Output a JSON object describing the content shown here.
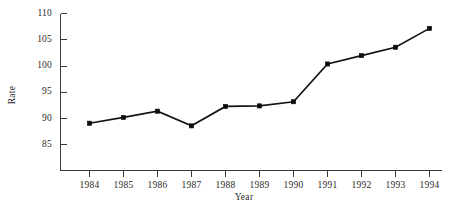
{
  "chart_data": {
    "type": "line",
    "title": "",
    "xlabel": "Year",
    "ylabel": "Rate",
    "grid": false,
    "legend": false,
    "legend_position": "none",
    "xlim": [
      1983.35,
      1994.5
    ],
    "ylim": [
      82.0,
      111.2
    ],
    "x_tick_labels": [
      "1984",
      "1985",
      "1986",
      "1987",
      "1988",
      "1989",
      "1990",
      "1991",
      "1992",
      "1993",
      "1994"
    ],
    "y_tick_labels": [
      "85",
      "90",
      "95",
      "100",
      "105",
      "110"
    ],
    "y_ticks": [
      85,
      90,
      95,
      100,
      105,
      110
    ],
    "x": [
      1984,
      1985,
      1986,
      1987,
      1988,
      1989,
      1990,
      1991,
      1992,
      1993,
      1994
    ],
    "categories": [
      "1984",
      "1985",
      "1986",
      "1987",
      "1988",
      "1989",
      "1990",
      "1991",
      "1992",
      "1993",
      "1994"
    ],
    "values": [
      89.1,
      90.2,
      91.4,
      88.6,
      92.3,
      92.4,
      93.2,
      100.4,
      102.0,
      103.6,
      107.2
    ],
    "series": [
      {
        "name": "Rate",
        "color": "#141414",
        "marker": "filled-square",
        "values": [
          89.1,
          90.2,
          91.4,
          88.6,
          92.3,
          92.4,
          93.2,
          100.4,
          102.0,
          103.6,
          107.2
        ]
      }
    ],
    "colors": {
      "line": "#141414",
      "marker": "#0d0d0d",
      "axis": "#3b3b3b",
      "text": "#2b2b2b",
      "background": "#ffffff"
    }
  }
}
